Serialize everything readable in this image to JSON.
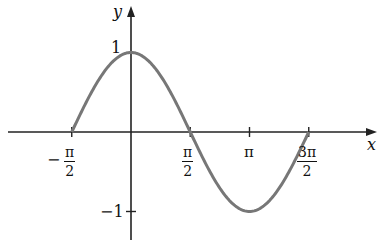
{
  "chart_data": {
    "type": "line",
    "title": "",
    "function": "cos(x)",
    "xlabel": "x",
    "ylabel": "y",
    "xlim": [
      -1.5708,
      4.7124
    ],
    "ylim": [
      -1,
      1
    ],
    "x_ticks": [
      {
        "value": -1.5708,
        "label_sign": "−",
        "label_num": "π",
        "label_den": "2"
      },
      {
        "value": 1.5708,
        "label_num": "π",
        "label_den": "2"
      },
      {
        "value": 3.1416,
        "label": "π"
      },
      {
        "value": 4.7124,
        "label_num": "3π",
        "label_den": "2"
      }
    ],
    "y_ticks": [
      {
        "value": 1,
        "label": "1"
      },
      {
        "value": -1,
        "label": "−1"
      }
    ],
    "series": [
      {
        "name": "y = cos x",
        "x": [
          -1.5708,
          -0.7854,
          0,
          0.7854,
          1.5708,
          2.3562,
          3.1416,
          3.927,
          4.7124
        ],
        "y": [
          0,
          0.7071,
          1,
          0.7071,
          0,
          -0.7071,
          -1,
          -0.7071,
          0
        ],
        "color": "#777777"
      }
    ],
    "grid": false,
    "legend": "none"
  },
  "labels": {
    "x_axis": "x",
    "y_axis": "y",
    "y_one": "1",
    "y_neg_one": "−1",
    "neg_sign": "−",
    "pi": "π",
    "two": "2",
    "three_pi": "3π"
  }
}
